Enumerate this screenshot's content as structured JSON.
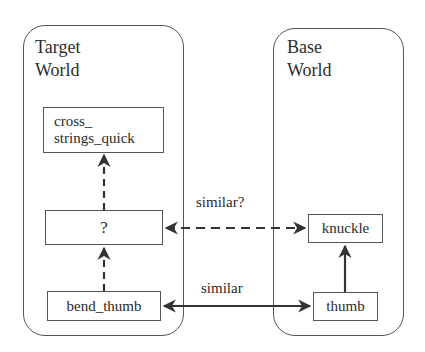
{
  "worlds": {
    "target": {
      "title_line1": "Target",
      "title_line2": "World"
    },
    "base": {
      "title_line1": "Base",
      "title_line2": "World"
    }
  },
  "nodes": {
    "cross_strings_quick": {
      "line1": "cross_",
      "line2": "strings_quick"
    },
    "unknown": {
      "label": "?"
    },
    "bend_thumb": {
      "label": "bend_thumb"
    },
    "knuckle": {
      "label": "knuckle"
    },
    "thumb": {
      "label": "thumb"
    }
  },
  "edges": [
    {
      "from": "bend_thumb",
      "to": "unknown",
      "style": "dashed",
      "direction": "forward"
    },
    {
      "from": "unknown",
      "to": "cross_strings_quick",
      "style": "dashed",
      "direction": "forward"
    },
    {
      "from": "thumb",
      "to": "knuckle",
      "style": "solid",
      "direction": "forward"
    },
    {
      "from": "unknown",
      "to": "knuckle",
      "style": "dashed",
      "direction": "bidirectional",
      "label": "similar?"
    },
    {
      "from": "bend_thumb",
      "to": "thumb",
      "style": "solid",
      "direction": "bidirectional",
      "label": "similar"
    }
  ],
  "edge_labels": {
    "similar_question": "similar?",
    "similar": "similar"
  },
  "colors": {
    "line": "#333333",
    "border": "#555555",
    "text": "#2b2b2b",
    "background": "#ffffff"
  }
}
